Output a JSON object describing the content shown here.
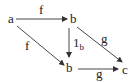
{
  "diagram": {
    "type": "commutative-diagram",
    "nodes": [
      {
        "id": "a",
        "label": "a"
      },
      {
        "id": "b_top",
        "label": "b"
      },
      {
        "id": "b_bottom",
        "label": "b"
      },
      {
        "id": "c",
        "label": "c"
      }
    ],
    "edges": [
      {
        "from": "a",
        "to": "b_top",
        "label": "f"
      },
      {
        "from": "a",
        "to": "b_bottom",
        "label": "f"
      },
      {
        "from": "b_top",
        "to": "b_bottom",
        "label": "1",
        "label_sub": "b"
      },
      {
        "from": "b_top",
        "to": "c",
        "label": "g"
      },
      {
        "from": "b_bottom",
        "to": "c",
        "label": "g"
      }
    ],
    "stroke_color": "#333333"
  }
}
